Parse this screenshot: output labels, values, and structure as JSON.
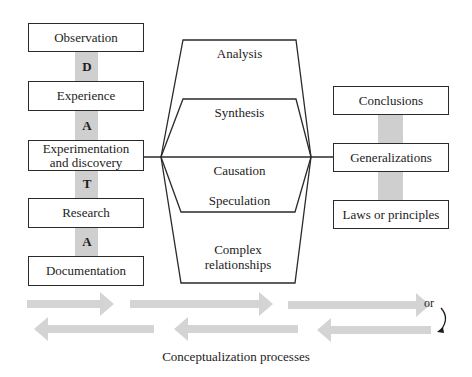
{
  "left_column": {
    "boxes": [
      {
        "label": "Observation"
      },
      {
        "label": "Experience"
      },
      {
        "label": "Experimentation and discovery"
      },
      {
        "label": "Research"
      },
      {
        "label": "Documentation"
      }
    ],
    "connector_letters": [
      "D",
      "A",
      "T",
      "A"
    ]
  },
  "center_funnel": {
    "labels": [
      "Analysis",
      "Synthesis",
      "Causation",
      "Speculation",
      "Complex relationships"
    ]
  },
  "right_column": {
    "boxes": [
      {
        "label": "Conclusions"
      },
      {
        "label": "Generalizations"
      },
      {
        "label": "Laws or principles"
      }
    ]
  },
  "arrows": {
    "forward_count": 3,
    "backward_count": 3,
    "or_label": "or",
    "arrow_color": "#d4d4d4"
  },
  "caption": "Conceptualization processes",
  "colors": {
    "line": "#2a2a2a",
    "bar": "#cfcfcf"
  }
}
